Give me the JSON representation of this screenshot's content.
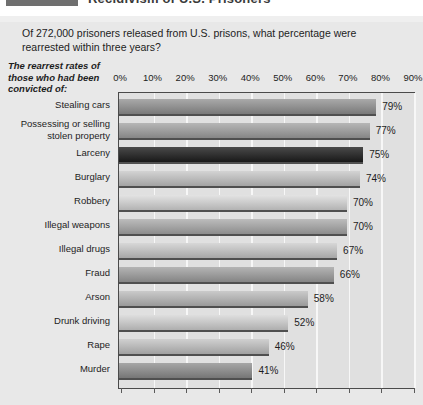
{
  "page_heading_remnant": {
    "cut_text": "Recidivism of U.S. Prisoners",
    "note": "partially cropped bold heading at top edge"
  },
  "question": "Of 272,000 prisoners released from U.S. prisons, what percentage were rearrested within three years?",
  "caption": "The rearrest rates of those who had been convicted of:",
  "chart_data": {
    "type": "bar",
    "orientation": "horizontal",
    "title": "Of 272,000 prisoners released from U.S. prisons, what percentage were rearrested within three years?",
    "subtitle": "The rearrest rates of those who had been convicted of:",
    "xlabel": "",
    "ylabel": "",
    "xlim": [
      0,
      90
    ],
    "grid": true,
    "legend": "none",
    "tick_labels": [
      "0%",
      "10%",
      "20%",
      "30%",
      "40%",
      "50%",
      "60%",
      "70%",
      "80%",
      "90%"
    ],
    "tick_values": [
      0,
      10,
      20,
      30,
      40,
      50,
      60,
      70,
      80,
      90
    ],
    "categories": [
      "Stealing cars",
      "Possessing or selling stolen property",
      "Larceny",
      "Burglary",
      "Robbery",
      "Illegal weapons",
      "Illegal drugs",
      "Fraud",
      "Arson",
      "Drunk driving",
      "Rape",
      "Murder"
    ],
    "values": [
      79,
      77,
      75,
      74,
      70,
      70,
      67,
      66,
      58,
      52,
      46,
      41
    ],
    "value_labels": [
      "79%",
      "77%",
      "75%",
      "74%",
      "70%",
      "70%",
      "67%",
      "66%",
      "58%",
      "52%",
      "46%",
      "41%"
    ],
    "bar_colors": [
      "#8f8f8f",
      "#9c9c9c",
      "#2f2f2f",
      "#b9b9b9",
      "#c9c9c9",
      "#a2a2a2",
      "#bdbdbd",
      "#9a9a9a",
      "#b0b0b0",
      "#c4c4c4",
      "#b6b6b6",
      "#8c8c8c"
    ],
    "category_label_lines": [
      [
        "Stealing cars"
      ],
      [
        "Possessing or selling",
        "stolen property"
      ],
      [
        "Larceny"
      ],
      [
        "Burglary"
      ],
      [
        "Robbery"
      ],
      [
        "Illegal weapons"
      ],
      [
        "Illegal drugs"
      ],
      [
        "Fraud"
      ],
      [
        "Arson"
      ],
      [
        "Drunk driving"
      ],
      [
        "Rape"
      ],
      [
        "Murder"
      ]
    ]
  },
  "colors": {
    "panel_background": "#e8e8e8",
    "plot_background": "#e0e0e0",
    "gridline": "#f7f7f7",
    "axis": "#4a4a4a",
    "text": "#1d1d1d"
  }
}
